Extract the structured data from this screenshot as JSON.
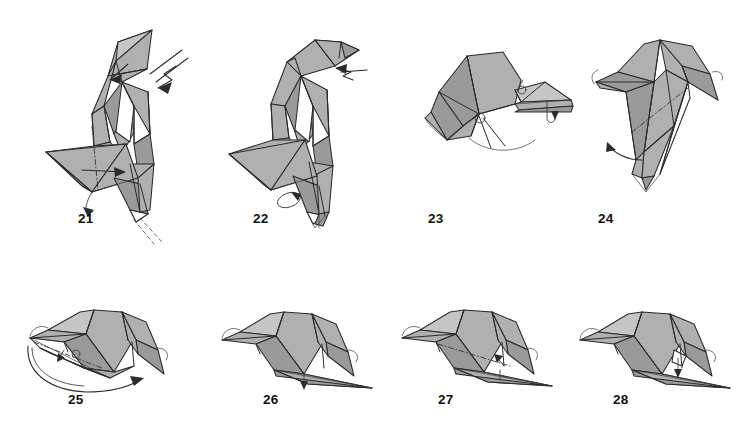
{
  "document": {
    "kind": "origami-instruction-diagram",
    "subject": "folded paper bird (toucan / parrot style) step sequence",
    "background_color": "#ffffff",
    "paper_front_color": "#b0b0b0",
    "paper_shadow_color": "#9a9a9a",
    "paper_back_color": "#ffffff",
    "line_color": "#2b2b2b",
    "columns": 4,
    "rows": 2
  },
  "steps": [
    {
      "number": "21",
      "label_x": 78,
      "label_y": 212,
      "description": "Upright bird form; crimp the head with a zigzag (reverse-fold) arrow at upper right, swing the wing at lower left, valley fold indicated at the base",
      "markers": [
        "zigzag-crimp-arrow",
        "small-straight-arrow",
        "curved-turn-arrow",
        "dash-dot-fold-line",
        "hidden-edge-dashes"
      ]
    },
    {
      "number": "22",
      "label_x": 253,
      "label_y": 212,
      "description": "Beak formed and pointing right; push-in arrow at the neck, small rotation loop at the tail base",
      "markers": [
        "zigzag-push-arrow",
        "small-loop-arrow"
      ]
    },
    {
      "number": "23",
      "label_x": 428,
      "label_y": 212,
      "description": "Model rotated to a horizontal orientation, head at left and long flat beak to the right; small hook arrow under the beak tip",
      "markers": [
        "small-hook-arrow",
        "small-circle-joint",
        "thin-guide-curve"
      ]
    },
    {
      "number": "24",
      "label_x": 598,
      "label_y": 212,
      "description": "View of the wing/body wedge with a mountain fold dash-dot line; curved arrow at lower left shows folding the flap upward and back",
      "markers": [
        "curved-fold-back-arrow",
        "dash-dot-fold-line"
      ]
    },
    {
      "number": "25",
      "label_x": 68,
      "label_y": 393,
      "description": "Horizontal bird head profile; large sweeping curved arrow at the bottom swings the beak layer around to the right",
      "markers": [
        "large-sweep-arrow",
        "dash-dot-fold-line",
        "small-hook-arrow"
      ]
    },
    {
      "number": "26",
      "label_x": 263,
      "label_y": 393,
      "description": "Head profile with the long beak now lying to the lower right; small pull arrow beneath the beak root",
      "markers": [
        "small-down-arrow"
      ]
    },
    {
      "number": "27",
      "label_x": 438,
      "label_y": 393,
      "description": "Same profile with a long dash-dot mountain fold across the head and a small arrow at the beak hinge",
      "markers": [
        "dash-dot-fold-line",
        "small-arrow"
      ]
    },
    {
      "number": "28",
      "label_x": 613,
      "label_y": 393,
      "description": "Finished head profile of the step sequence with the crest folded, small valley arrow at the beak hinge",
      "markers": [
        "small-valley-arrow"
      ]
    }
  ]
}
